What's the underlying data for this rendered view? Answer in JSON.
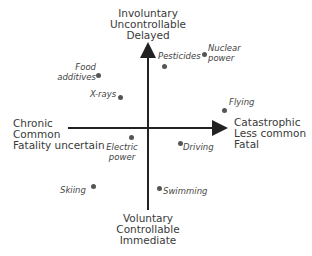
{
  "diagram": {
    "axes": {
      "top": [
        "Involuntary",
        "Uncontrollable",
        "Delayed"
      ],
      "bottom": [
        "Voluntary",
        "Controllable",
        "Immediate"
      ],
      "left": [
        "Chronic",
        "Common",
        "Fatality uncertain"
      ],
      "right": [
        "Catastrophic",
        "Less common",
        "Fatal"
      ]
    },
    "points": [
      {
        "label_lines": [
          "Nuclear",
          "power"
        ],
        "dot": [
          205,
          55
        ]
      },
      {
        "label_lines": [
          "Pesticides"
        ],
        "dot": [
          150,
          66
        ]
      },
      {
        "label_lines": [
          "Food",
          "additives"
        ],
        "dot": [
          99,
          76
        ]
      },
      {
        "label_lines": [
          "X-rays"
        ],
        "dot": [
          121,
          98
        ]
      },
      {
        "label_lines": [
          "Flying"
        ],
        "dot": [
          225,
          111
        ]
      },
      {
        "label_lines": [
          "Electric",
          "power"
        ],
        "dot": [
          132,
          138
        ]
      },
      {
        "label_lines": [
          "Driving"
        ],
        "dot": [
          181,
          144
        ]
      },
      {
        "label_lines": [
          "Skiing"
        ],
        "dot": [
          94,
          187
        ]
      },
      {
        "label_lines": [
          "Swimming"
        ],
        "dot": [
          160,
          190
        ]
      }
    ],
    "colors": {
      "axis": "#222222",
      "dot": "#555555",
      "text": "#3a3a3a"
    }
  }
}
